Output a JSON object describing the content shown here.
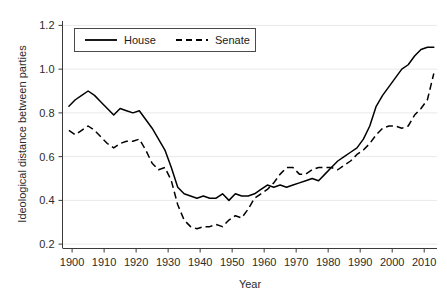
{
  "chart_data": {
    "type": "line",
    "title": "",
    "xlabel": "Year",
    "ylabel": "Ideological distance between parties",
    "xlim": [
      1897,
      2014
    ],
    "ylim": [
      0.18,
      1.22
    ],
    "grid": true,
    "legend_position": "top-left-inside",
    "xticks": [
      1900,
      1910,
      1920,
      1930,
      1940,
      1950,
      1960,
      1970,
      1980,
      1990,
      2000,
      2010
    ],
    "xtick_labels": [
      "1900",
      "1910",
      "1920",
      "1930",
      "1940",
      "1950",
      "1960",
      "1970",
      "1980",
      "1990",
      "2000",
      "2010"
    ],
    "yticks": [
      0.2,
      0.4,
      0.6,
      0.8,
      1.0,
      1.2
    ],
    "ytick_labels": [
      "0.2",
      "0.4",
      "0.6",
      "0.8",
      "1.0",
      "1.2"
    ],
    "series": [
      {
        "name": "House",
        "style": "solid",
        "color": "#000000",
        "x": [
          1899,
          1901,
          1903,
          1905,
          1907,
          1909,
          1911,
          1913,
          1915,
          1917,
          1919,
          1921,
          1923,
          1925,
          1927,
          1929,
          1931,
          1933,
          1935,
          1937,
          1939,
          1941,
          1943,
          1945,
          1947,
          1949,
          1951,
          1953,
          1955,
          1957,
          1959,
          1961,
          1963,
          1965,
          1967,
          1969,
          1971,
          1973,
          1975,
          1977,
          1979,
          1981,
          1983,
          1985,
          1987,
          1989,
          1991,
          1993,
          1995,
          1997,
          1999,
          2001,
          2003,
          2005,
          2007,
          2009,
          2011,
          2013
        ],
        "values": [
          0.83,
          0.86,
          0.88,
          0.9,
          0.88,
          0.85,
          0.82,
          0.79,
          0.82,
          0.81,
          0.8,
          0.81,
          0.77,
          0.73,
          0.68,
          0.63,
          0.55,
          0.46,
          0.43,
          0.42,
          0.41,
          0.42,
          0.41,
          0.41,
          0.43,
          0.4,
          0.43,
          0.42,
          0.42,
          0.43,
          0.45,
          0.47,
          0.46,
          0.47,
          0.46,
          0.47,
          0.48,
          0.49,
          0.5,
          0.49,
          0.52,
          0.55,
          0.58,
          0.6,
          0.62,
          0.64,
          0.68,
          0.74,
          0.83,
          0.88,
          0.92,
          0.96,
          1.0,
          1.02,
          1.06,
          1.09,
          1.1,
          1.1
        ]
      },
      {
        "name": "Senate",
        "style": "dashed",
        "color": "#000000",
        "x": [
          1899,
          1901,
          1903,
          1905,
          1907,
          1909,
          1911,
          1913,
          1915,
          1917,
          1919,
          1921,
          1923,
          1925,
          1927,
          1929,
          1931,
          1933,
          1935,
          1937,
          1939,
          1941,
          1943,
          1945,
          1947,
          1949,
          1951,
          1953,
          1955,
          1957,
          1959,
          1961,
          1963,
          1965,
          1967,
          1969,
          1971,
          1973,
          1975,
          1977,
          1979,
          1981,
          1983,
          1985,
          1987,
          1989,
          1991,
          1993,
          1995,
          1997,
          1999,
          2001,
          2003,
          2005,
          2007,
          2009,
          2011,
          2013
        ],
        "values": [
          0.72,
          0.7,
          0.72,
          0.74,
          0.72,
          0.69,
          0.66,
          0.64,
          0.66,
          0.67,
          0.67,
          0.68,
          0.63,
          0.57,
          0.54,
          0.55,
          0.49,
          0.38,
          0.31,
          0.28,
          0.27,
          0.28,
          0.28,
          0.29,
          0.28,
          0.31,
          0.33,
          0.32,
          0.36,
          0.41,
          0.43,
          0.45,
          0.48,
          0.52,
          0.55,
          0.55,
          0.52,
          0.52,
          0.54,
          0.55,
          0.55,
          0.55,
          0.54,
          0.56,
          0.58,
          0.61,
          0.63,
          0.66,
          0.7,
          0.73,
          0.74,
          0.74,
          0.73,
          0.74,
          0.79,
          0.82,
          0.86,
          0.98
        ]
      }
    ]
  },
  "legend": {
    "entries": [
      {
        "label": "House"
      },
      {
        "label": "Senate"
      }
    ]
  },
  "axes": {
    "y_title": "Ideological distance between parties",
    "x_title": "Year"
  }
}
